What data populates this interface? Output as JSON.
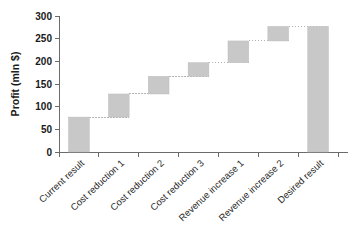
{
  "chart_data": {
    "type": "bar",
    "subtype": "waterfall",
    "title": "",
    "xlabel": "",
    "ylabel": "Profit (mln $)",
    "ylim": [
      0,
      300
    ],
    "ytick_step": 50,
    "yticks": [
      "0",
      "50",
      "100",
      "150",
      "200",
      "250",
      "300"
    ],
    "grid": false,
    "legend": null,
    "legend_position": "none",
    "bar_color": "#c8c8c8",
    "connector_color": "#b4b4b4",
    "categories": [
      "Current result",
      "Cost reduction 1",
      "Cost reduction 2",
      "Cost reduction 3",
      "Revenue increase 1",
      "Revenue increase 2",
      "Desired result"
    ],
    "bars": [
      {
        "label": "Current result",
        "base": 0,
        "top": 77,
        "delta": 77,
        "kind": "total"
      },
      {
        "label": "Cost reduction 1",
        "base": 77,
        "top": 128,
        "delta": 51,
        "kind": "increase"
      },
      {
        "label": "Cost reduction 2",
        "base": 128,
        "top": 167,
        "delta": 39,
        "kind": "increase"
      },
      {
        "label": "Cost reduction 3",
        "base": 167,
        "top": 197,
        "delta": 30,
        "kind": "increase"
      },
      {
        "label": "Revenue increase 1",
        "base": 197,
        "top": 245,
        "delta": 48,
        "kind": "increase"
      },
      {
        "label": "Revenue increase 2",
        "base": 245,
        "top": 277,
        "delta": 32,
        "kind": "increase"
      },
      {
        "label": "Desired result",
        "base": 0,
        "top": 277,
        "delta": 277,
        "kind": "total"
      }
    ],
    "values": [
      77,
      51,
      39,
      30,
      48,
      32,
      277
    ],
    "cumulative": [
      77,
      128,
      167,
      197,
      245,
      277,
      277
    ]
  }
}
